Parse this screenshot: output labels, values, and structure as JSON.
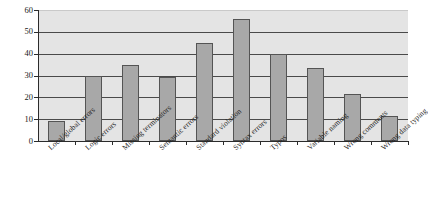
{
  "chart_data": {
    "type": "bar",
    "title": "",
    "xlabel": "",
    "ylabel": "",
    "ylim": [
      0,
      60
    ],
    "yticks": [
      0,
      10,
      20,
      30,
      40,
      50,
      60
    ],
    "grid": true,
    "legend": null,
    "categories": [
      "Local/global errors",
      "Logic errors",
      "Missing terminators",
      "Semantic errors",
      "Standard violation",
      "Syntax errors",
      "Typos",
      "Variable naming",
      "Wrong comments",
      "Wrong data typing"
    ],
    "values": [
      9,
      30,
      35,
      29.5,
      45,
      56,
      40,
      33.5,
      21.5,
      11.5
    ],
    "colors": {
      "bar_fill": "#a8a8a8",
      "bar_stroke": "#545454",
      "plot_background": "#e4e4e4",
      "gridline": "#4a4a4a",
      "axis": "#2b2b2b",
      "text": "#1a1a1a",
      "page_background": "#ffffff"
    }
  },
  "axes": {
    "y_tick_labels": [
      "0",
      "10",
      "20",
      "30",
      "40",
      "50",
      "60"
    ]
  },
  "clipped_title": ""
}
